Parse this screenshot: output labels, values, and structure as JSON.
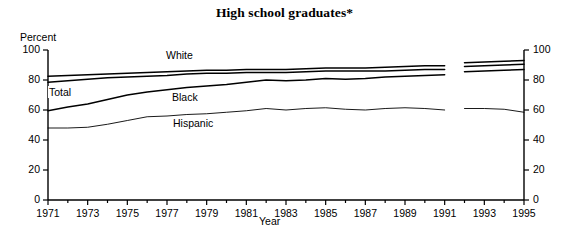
{
  "title": "High school graduates*",
  "axes": {
    "ylabel": "Percent",
    "xlabel": "Year",
    "yticks": [
      "0",
      "20",
      "40",
      "60",
      "80",
      "100"
    ],
    "yticks_right": [
      "0",
      "20",
      "40",
      "60",
      "80",
      "100"
    ],
    "xticks": [
      "1971",
      "1973",
      "1975",
      "1977",
      "1979",
      "1981",
      "1983",
      "1985",
      "1987",
      "1989",
      "1991",
      "1993",
      "1995"
    ]
  },
  "series_labels": {
    "white": "White",
    "total": "Total",
    "black": "Black",
    "hispanic": "Hispanic"
  },
  "chart_data": {
    "type": "line",
    "title": "High school graduates*",
    "xlabel": "Year",
    "ylabel": "Percent",
    "ylim": [
      0,
      100
    ],
    "xlim": [
      1971,
      1995
    ],
    "grid": false,
    "legend": "inline-annotations",
    "ytick_values": [
      0,
      20,
      40,
      60,
      80,
      100
    ],
    "xtick_values": [
      1971,
      1973,
      1975,
      1977,
      1979,
      1981,
      1983,
      1985,
      1987,
      1989,
      1991,
      1993,
      1995
    ],
    "note": "Series are broken between 1991 and 1992 (discontinuity in the data).",
    "x": [
      1971,
      1972,
      1973,
      1974,
      1975,
      1976,
      1977,
      1978,
      1979,
      1980,
      1981,
      1982,
      1983,
      1984,
      1985,
      1986,
      1987,
      1988,
      1989,
      1990,
      1991,
      1992,
      1993,
      1994,
      1995
    ],
    "series": [
      {
        "name": "White",
        "values": [
          82.5,
          83.0,
          83.5,
          84.0,
          84.5,
          85.0,
          85.5,
          86.0,
          86.5,
          86.5,
          87.0,
          87.0,
          87.0,
          87.5,
          88.0,
          88.0,
          88.0,
          88.5,
          89.0,
          89.5,
          89.5,
          91.5,
          92.0,
          92.5,
          93.0
        ]
      },
      {
        "name": "Total",
        "values": [
          78.5,
          79.5,
          80.5,
          81.5,
          82.0,
          82.5,
          83.0,
          84.0,
          84.5,
          84.5,
          85.0,
          85.0,
          85.0,
          85.5,
          86.0,
          86.0,
          86.0,
          86.0,
          86.5,
          87.0,
          87.0,
          89.0,
          89.5,
          90.0,
          90.5
        ]
      },
      {
        "name": "Black",
        "values": [
          59.5,
          62.0,
          64.0,
          67.0,
          70.0,
          72.0,
          73.5,
          75.0,
          76.0,
          77.0,
          78.5,
          80.0,
          79.5,
          80.0,
          81.0,
          80.5,
          81.0,
          82.0,
          82.5,
          83.0,
          83.5,
          85.5,
          86.0,
          86.5,
          87.0
        ]
      },
      {
        "name": "Hispanic",
        "values": [
          48.0,
          48.0,
          48.5,
          50.5,
          53.0,
          55.5,
          56.0,
          57.0,
          57.5,
          58.5,
          59.5,
          61.0,
          60.0,
          61.0,
          61.5,
          60.5,
          60.0,
          61.0,
          61.5,
          61.0,
          60.0,
          61.0,
          61.0,
          60.5,
          58.5
        ]
      }
    ]
  }
}
